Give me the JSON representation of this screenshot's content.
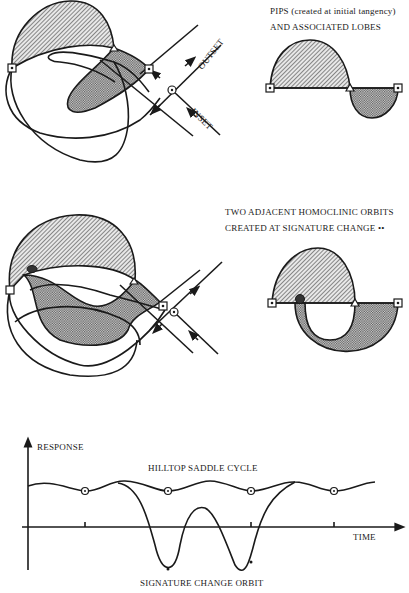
{
  "panel1": {
    "title_line1": "PIPS (created at initial tangency)",
    "title_line2": "AND ASSOCIATED LOBES",
    "outset_label": "OUTSET",
    "inset_label": "INSET"
  },
  "panel2": {
    "title_line1": "TWO ADJACENT HOMOCLINIC ORBITS",
    "title_line2": "CREATED AT SIGNATURE CHANGE ••"
  },
  "panel3": {
    "y_axis_label": "RESPONSE",
    "x_axis_label": "TIME",
    "upper_curve_label": "HILLTOP SADDLE CYCLE",
    "lower_curve_label": "SIGNATURE CHANGE ORBIT"
  },
  "colors": {
    "ink": "#1a1a1a",
    "background": "#ffffff",
    "hatch": "#555555",
    "stipple": "#777777"
  }
}
